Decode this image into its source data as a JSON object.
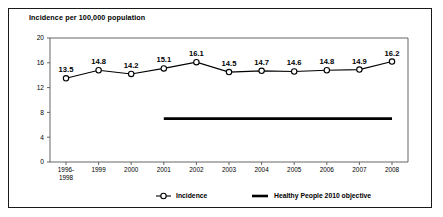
{
  "figure": {
    "width": 443,
    "height": 217,
    "background": "#ffffff",
    "border_color": "#1a1a1a"
  },
  "chart_data": {
    "type": "line",
    "title": "Incidence per 100,000 population",
    "xlabel": "",
    "ylabel": "",
    "ylim": [
      0,
      20
    ],
    "yticks": [
      0,
      4,
      8,
      12,
      16,
      20
    ],
    "ytick_labels": [
      "0",
      "4",
      "8",
      "12",
      "16",
      "20"
    ],
    "grid": false,
    "legend_position": "bottom",
    "categories": [
      "1996-1998",
      "1999",
      "2000",
      "2001",
      "2002",
      "2003",
      "2004",
      "2005",
      "2006",
      "2007",
      "2008"
    ],
    "category_lines": [
      [
        "1996-",
        "1998"
      ],
      [
        "1999"
      ],
      [
        "2000"
      ],
      [
        "2001"
      ],
      [
        "2002"
      ],
      [
        "2003"
      ],
      [
        "2004"
      ],
      [
        "2005"
      ],
      [
        "2006"
      ],
      [
        "2007"
      ],
      [
        "2008"
      ]
    ],
    "series": [
      {
        "name": "Incidence",
        "marker": "open-circle",
        "color": "#000000",
        "values": [
          13.5,
          14.8,
          14.2,
          15.1,
          16.1,
          14.5,
          14.7,
          14.6,
          14.8,
          14.9,
          16.2
        ],
        "data_labels": [
          "13.5",
          "14.8",
          "14.2",
          "15.1",
          "16.1",
          "14.5",
          "14.7",
          "14.6",
          "14.8",
          "14.9",
          "16.2"
        ]
      },
      {
        "name": "Healthy People 2010 objective",
        "marker": "thick-line",
        "color": "#000000",
        "value": 7.0,
        "span_categories": [
          "2001",
          "2008"
        ]
      }
    ],
    "legend": [
      {
        "label": "Incidence",
        "marker": "line-open-circle"
      },
      {
        "label": "Healthy People 2010 objective",
        "marker": "thick-line"
      }
    ]
  }
}
